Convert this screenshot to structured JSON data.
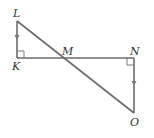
{
  "diagram": {
    "points": {
      "L": {
        "label": "L"
      },
      "K": {
        "label": "K"
      },
      "M": {
        "label": "M"
      },
      "N": {
        "label": "N"
      },
      "O": {
        "label": "O"
      }
    },
    "segments": [
      "LK",
      "KN",
      "LO",
      "NO"
    ],
    "right_angles": [
      "K",
      "N"
    ],
    "parallel_marks": [
      "LK",
      "NO"
    ],
    "colors": {
      "line": "#6b6b6b",
      "text": "#333333"
    }
  }
}
